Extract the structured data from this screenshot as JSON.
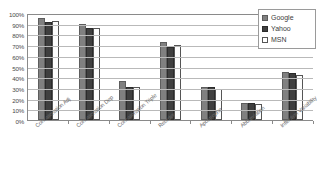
{
  "chart_data": {
    "type": "bar",
    "title": "",
    "xlabel": "",
    "ylabel": "",
    "ylim": [
      0,
      100
    ],
    "ytick_labels": [
      "100%",
      "90%",
      "80%",
      "70%",
      "60%",
      "50%",
      "40%",
      "30%",
      "20%",
      "10%",
      "0%"
    ],
    "ytick_values": [
      100,
      90,
      80,
      70,
      60,
      50,
      40,
      30,
      20,
      10,
      0
    ],
    "grid": true,
    "legend_position": "top-right",
    "categories": [
      "Concatenation Adj",
      "Concatenation Dep",
      "Concatenation Triple",
      "Reorder",
      "Apostrophe",
      "Abbreviation",
      "Inflection Variability"
    ],
    "series": [
      {
        "name": "Google",
        "color": "#808080",
        "values": [
          95,
          90,
          36,
          73,
          31,
          16,
          45
        ]
      },
      {
        "name": "Yahoo",
        "color": "#3f3f3f",
        "values": [
          92,
          86,
          31,
          68,
          31,
          16,
          44
        ]
      },
      {
        "name": "MSN",
        "color": "#ffffff",
        "values": [
          93,
          86,
          31,
          70,
          29,
          15,
          42
        ]
      }
    ]
  },
  "legend": {
    "items": [
      {
        "label": "Google"
      },
      {
        "label": "Yahoo"
      },
      {
        "label": "MSN"
      }
    ]
  }
}
